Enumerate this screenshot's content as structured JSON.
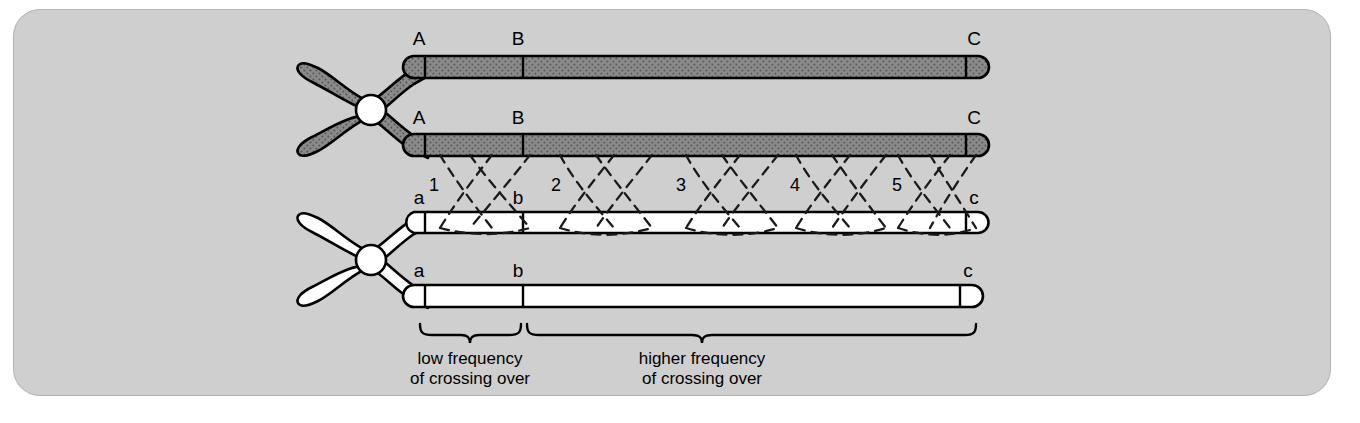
{
  "figure": {
    "panel_background": "#cfcfcf",
    "page_background": "#ffffff",
    "dark_chromatid_color": "#8a8a8a",
    "light_chromatid_color": "#ffffff",
    "outline_color": "#000000",
    "centromere_color": "#ffffff"
  },
  "chromatids": [
    {
      "id": "dark-1",
      "shade": "dark",
      "gene_labels": [
        "A",
        "B",
        "C"
      ]
    },
    {
      "id": "dark-2",
      "shade": "dark",
      "gene_labels": [
        "A",
        "B",
        "C"
      ]
    },
    {
      "id": "light-1",
      "shade": "light",
      "gene_labels": [
        "a",
        "b",
        "c"
      ]
    },
    {
      "id": "light-2",
      "shade": "light",
      "gene_labels": [
        "a",
        "b",
        "c"
      ]
    }
  ],
  "gene_loci": {
    "upper": {
      "first": "A",
      "second": "B",
      "third": "C"
    },
    "lower": {
      "first": "a",
      "second": "b",
      "third": "c"
    }
  },
  "crossover_points": [
    {
      "number": "1"
    },
    {
      "number": "2"
    },
    {
      "number": "3"
    },
    {
      "number": "4"
    },
    {
      "number": "5"
    }
  ],
  "brackets": [
    {
      "id": "low-frequency",
      "line1": "low frequency",
      "line2": "of crossing over"
    },
    {
      "id": "higher-frequency",
      "line1": "higher frequency",
      "line2": "of crossing over"
    }
  ]
}
